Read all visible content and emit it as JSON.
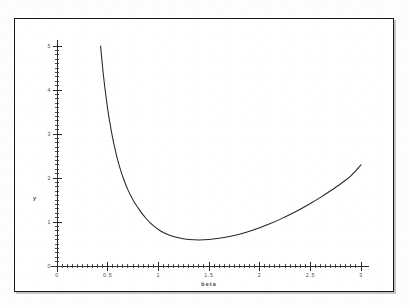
{
  "figure": {
    "background_color": "#ffffff",
    "frame_color": "#1a1a1a",
    "curve_color": "#262626",
    "axis_color": "#2b2b2b"
  },
  "chart_data": {
    "type": "line",
    "title": "",
    "xlabel": "beta",
    "ylabel": "y",
    "xlim": [
      0,
      3
    ],
    "ylim": [
      0,
      5
    ],
    "grid": false,
    "legend": null,
    "x_tick_labels": [
      "0",
      "0.5",
      "1",
      "1.5",
      "2",
      "2.5",
      "3"
    ],
    "x_tick_values": [
      0,
      0.5,
      1,
      1.5,
      2,
      2.5,
      3
    ],
    "x_minor_tick_step": 0.05,
    "y_tick_labels": [
      "0",
      "1",
      "2",
      "3",
      "4",
      "5"
    ],
    "y_tick_values": [
      0,
      1,
      2,
      3,
      4,
      5
    ],
    "y_minor_tick_step": 0.1,
    "series": [
      {
        "name": "y(beta)",
        "x": [
          0.43,
          0.45,
          0.47,
          0.5,
          0.52,
          0.55,
          0.58,
          0.6,
          0.63,
          0.66,
          0.7,
          0.73,
          0.76,
          0.8,
          0.84,
          0.88,
          0.92,
          0.96,
          1.0,
          1.05,
          1.1,
          1.15,
          1.2,
          1.25,
          1.3,
          1.4,
          1.5,
          1.6,
          1.7,
          1.8,
          1.9,
          2.0,
          2.1,
          2.2,
          2.3,
          2.4,
          2.5,
          2.6,
          2.7,
          2.8,
          2.9,
          3.0
        ],
        "y": [
          5.0,
          4.52,
          4.1,
          3.57,
          3.28,
          2.9,
          2.58,
          2.4,
          2.16,
          1.96,
          1.73,
          1.59,
          1.46,
          1.32,
          1.19,
          1.08,
          0.98,
          0.9,
          0.83,
          0.76,
          0.71,
          0.67,
          0.64,
          0.62,
          0.6,
          0.59,
          0.6,
          0.63,
          0.67,
          0.72,
          0.79,
          0.87,
          0.96,
          1.06,
          1.17,
          1.29,
          1.42,
          1.56,
          1.71,
          1.87,
          2.05,
          2.3
        ]
      }
    ],
    "annotations": {
      "minimum_x": 1.05,
      "minimum_y": 0.48,
      "curve_start_x": 0.43,
      "curve_start_y": 5.0,
      "curve_end_x": 3.0,
      "curve_end_y": 2.3
    }
  }
}
